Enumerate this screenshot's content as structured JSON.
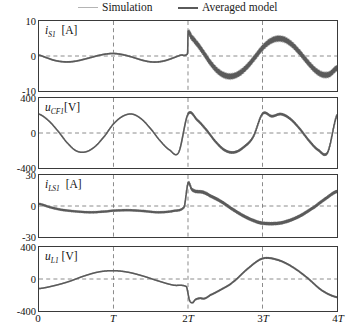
{
  "figure": {
    "kind": "multi-panel time series",
    "legend": {
      "items": [
        {
          "label": "Simulation",
          "color": "#b4b4b4",
          "width": 1.6
        },
        {
          "label": "Averaged model",
          "color": "#5a5a5a",
          "width": 2.4
        }
      ]
    },
    "xaxis": {
      "ticks": [
        "0",
        "T",
        "2T",
        "3T",
        "4T"
      ],
      "tick_values": [
        0,
        1,
        2,
        3,
        4
      ],
      "range": [
        0,
        4
      ],
      "gridlines_at": [
        1,
        2,
        3
      ]
    }
  },
  "panels": [
    {
      "id": "panel-is1",
      "signal": "i",
      "subscript": "S1",
      "unit": "[A]",
      "yticks": [
        "10",
        "0",
        "-10"
      ],
      "ytick_values": [
        10,
        0,
        -10
      ],
      "ylim": [
        -12.5,
        12.5
      ]
    },
    {
      "id": "panel-ucf1",
      "signal": "u",
      "subscript": "CF1",
      "unit": "[V]",
      "yticks": [
        "400",
        "0",
        "-400"
      ],
      "ytick_values": [
        400,
        0,
        -400
      ],
      "ylim": [
        -500,
        500
      ]
    },
    {
      "id": "panel-ils1",
      "signal": "i",
      "subscript": "LS1",
      "unit": "[A]",
      "yticks": [
        "30",
        "0",
        "-30"
      ],
      "ytick_values": [
        30,
        0,
        -30
      ],
      "ylim": [
        -37,
        37
      ]
    },
    {
      "id": "panel-ul1",
      "signal": "u",
      "subscript": "L1",
      "unit": "[V]",
      "yticks": [
        "400",
        "0",
        "-400"
      ],
      "ytick_values": [
        400,
        0,
        -400
      ],
      "ylim": [
        -500,
        500
      ]
    }
  ],
  "chart_data": [
    {
      "type": "line",
      "title": "",
      "xlabel": "",
      "ylabel": "i_S1 [A]",
      "xlim": [
        0,
        4
      ],
      "ylim": [
        -12.5,
        12.5
      ],
      "xticklabels": [
        "0",
        "T",
        "2T",
        "3T",
        "4T"
      ],
      "yticklabels": [
        "10",
        "0",
        "-10"
      ],
      "grid": "dashed vertical at T,2T,3T and dashed horizontal at 0",
      "legend": [
        "Simulation",
        "Averaged model"
      ],
      "series": [
        {
          "name": "Averaged model",
          "color": "#5a5a5a",
          "description": "low amplitude (approx +-2 A) slow oscillation for 0..2T, step jump to +8 A at 2T then large oscillation +-7 A with high-frequency switching ripple",
          "x": [
            0.0,
            0.1,
            0.2,
            0.3,
            0.4,
            0.5,
            0.6,
            0.7,
            0.8,
            0.9,
            1.0,
            1.1,
            1.2,
            1.3,
            1.4,
            1.5,
            1.6,
            1.7,
            1.8,
            1.9,
            1.995,
            2.0,
            2.05,
            2.1,
            2.2,
            2.3,
            2.4,
            2.5,
            2.6,
            2.7,
            2.8,
            2.9,
            3.0,
            3.1,
            3.2,
            3.3,
            3.4,
            3.5,
            3.6,
            3.7,
            3.8,
            3.9,
            4.0
          ],
          "y": [
            0.3,
            -0.6,
            -1.5,
            -2.0,
            -2.1,
            -1.8,
            -1.2,
            -0.5,
            0.2,
            0.7,
            0.9,
            0.6,
            0.0,
            -0.8,
            -1.6,
            -2.1,
            -2.1,
            -1.6,
            -0.7,
            0.3,
            0.9,
            8.1,
            6.6,
            5.0,
            1.5,
            -2.4,
            -5.4,
            -7.0,
            -7.2,
            -6.0,
            -3.6,
            -0.4,
            2.9,
            5.2,
            6.2,
            5.8,
            4.0,
            1.2,
            -2.0,
            -4.9,
            -6.6,
            -6.5,
            -4.3
          ]
        },
        {
          "name": "Simulation",
          "color": "#b4b4b4",
          "description": "same trajectory with superimposed switching ripple envelope"
        }
      ]
    },
    {
      "type": "line",
      "title": "",
      "xlabel": "",
      "ylabel": "u_CF1 [V]",
      "xlim": [
        0,
        4
      ],
      "ylim": [
        -500,
        500
      ],
      "xticklabels": [
        "0",
        "T",
        "2T",
        "3T",
        "4T"
      ],
      "yticklabels": [
        "400",
        "0",
        "-400"
      ],
      "grid": "dashed vertical at T,2T,3T and dashed horizontal at 0",
      "legend": [
        "Simulation",
        "Averaged model"
      ],
      "series": [
        {
          "name": "Averaged model",
          "color": "#5a5a5a",
          "description": "sinusoid of period T, amplitude approx 280 V, peaks at 0,T,2T,3T,4T, troughs at 0.5T,1.5T,2.5T,3.5T; small ripple after 2T",
          "x": [
            0.0,
            0.125,
            0.25,
            0.375,
            0.5,
            0.625,
            0.75,
            0.875,
            1.0,
            1.125,
            1.25,
            1.375,
            1.5,
            1.625,
            1.75,
            1.875,
            2.0,
            2.125,
            2.25,
            2.375,
            2.5,
            2.625,
            2.75,
            2.875,
            3.0,
            3.125,
            3.25,
            3.375,
            3.5,
            3.625,
            3.75,
            3.875,
            4.0
          ],
          "y": [
            270,
            180,
            35,
            -135,
            -255,
            -270,
            -195,
            -50,
            130,
            240,
            270,
            200,
            60,
            -110,
            -240,
            -275,
            270,
            185,
            40,
            -130,
            -250,
            -275,
            -200,
            -55,
            275,
            240,
            270,
            200,
            60,
            -110,
            -245,
            -275,
            255
          ]
        },
        {
          "name": "Simulation",
          "color": "#b4b4b4",
          "description": "overlaid with switching ripple visible after 2T"
        }
      ]
    },
    {
      "type": "line",
      "title": "",
      "xlabel": "",
      "ylabel": "i_LS1 [A]",
      "xlim": [
        0,
        4
      ],
      "ylim": [
        -37,
        37
      ],
      "xticklabels": [
        "0",
        "T",
        "2T",
        "3T",
        "4T"
      ],
      "yticklabels": [
        "30",
        "0",
        "-30"
      ],
      "grid": "dashed vertical at T,2T,3T and dashed horizontal at 0",
      "legend": [
        "Simulation",
        "Averaged model"
      ],
      "series": [
        {
          "name": "Averaged model",
          "color": "#5a5a5a",
          "description": "small negative excursion approx -8 A during 0..2T, spike to +27 A at 2T, decaying to -21 A near 3T then rising to +18 A at 4T",
          "x": [
            0.0,
            0.15,
            0.3,
            0.5,
            0.7,
            0.9,
            1.0,
            1.2,
            1.4,
            1.6,
            1.8,
            1.95,
            2.0,
            2.05,
            2.1,
            2.2,
            2.3,
            2.45,
            2.6,
            2.75,
            2.9,
            3.0,
            3.15,
            3.3,
            3.5,
            3.7,
            3.85,
            4.0
          ],
          "y": [
            2.5,
            -1.5,
            -4.5,
            -6.5,
            -7.5,
            -6.5,
            -5.5,
            -5.0,
            -6.0,
            -7.5,
            -6.0,
            -1.0,
            27.0,
            20.0,
            17.5,
            16.5,
            12.0,
            5.0,
            -4.0,
            -12.0,
            -18.0,
            -20.5,
            -21.0,
            -19.0,
            -12.0,
            -1.0,
            9.0,
            17.5
          ]
        },
        {
          "name": "Simulation",
          "color": "#b4b4b4",
          "description": "overlaid, thicker band due to ripple"
        }
      ]
    },
    {
      "type": "line",
      "title": "",
      "xlabel": "",
      "ylabel": "u_L1 [V]",
      "xlim": [
        0,
        4
      ],
      "ylim": [
        -500,
        500
      ],
      "xticklabels": [
        "0",
        "T",
        "2T",
        "3T",
        "4T"
      ],
      "yticklabels": [
        "400",
        "0",
        "-400"
      ],
      "grid": "dashed vertical at T,2T,3T and dashed horizontal at 0",
      "legend": [
        "Simulation",
        "Averaged model"
      ],
      "series": [
        {
          "name": "Averaged model",
          "color": "#5a5a5a",
          "description": "starts near -150 V, rises to +130 V at T, falls to -120 V before 2T, sharp dip to -370 V just after 2T, rises to +320 V at 3T, falls to -290 V at 4T",
          "x": [
            0.0,
            0.2,
            0.4,
            0.6,
            0.8,
            1.0,
            1.2,
            1.4,
            1.6,
            1.8,
            1.98,
            2.02,
            2.06,
            2.1,
            2.16,
            2.22,
            2.3,
            2.45,
            2.6,
            2.8,
            3.0,
            3.2,
            3.4,
            3.6,
            3.8,
            4.0
          ],
          "y": [
            -150,
            -105,
            -40,
            45,
            110,
            130,
            105,
            45,
            -30,
            -95,
            -120,
            -330,
            -370,
            -320,
            -300,
            -305,
            -250,
            -160,
            -50,
            160,
            320,
            300,
            190,
            20,
            -180,
            -285
          ]
        },
        {
          "name": "Simulation",
          "color": "#b4b4b4",
          "description": "nearly identical, slight ripple"
        }
      ]
    }
  ]
}
